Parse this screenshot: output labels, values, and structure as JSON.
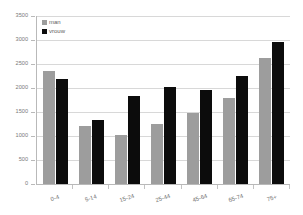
{
  "chart_data": {
    "type": "bar",
    "title": "",
    "subtitle": "",
    "xlabel": "",
    "ylabel": "",
    "categories": [
      "0-4",
      "5-14",
      "15-24",
      "25-44",
      "45-64",
      "65-74",
      "75+"
    ],
    "series": [
      {
        "name": "man",
        "color": "#9d9d9d",
        "values": [
          2350,
          1200,
          1030,
          1260,
          1480,
          1800,
          2620
        ]
      },
      {
        "name": "vrouw",
        "color": "#0c0c0c",
        "values": [
          2180,
          1330,
          1830,
          2030,
          1960,
          2250,
          2950
        ]
      }
    ],
    "ylim": [
      0,
      3500
    ],
    "yticks": [
      0,
      500,
      1000,
      1500,
      2000,
      2500,
      3000,
      3500
    ],
    "ytick_labels": [
      "0",
      "500",
      "1000",
      "1500",
      "2000",
      "2500",
      "3000",
      "3500"
    ],
    "grid": true,
    "legend_position": "top-left",
    "axis_color": "#b9b9b9",
    "grid_color": "#d8d8d8",
    "background": "#ffffff"
  }
}
